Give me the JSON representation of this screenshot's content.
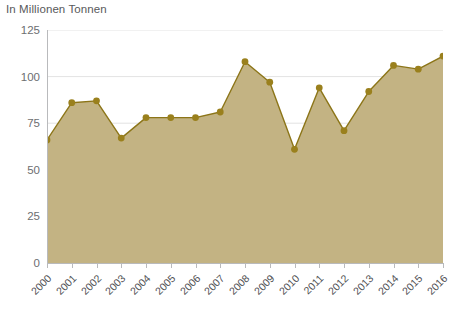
{
  "chart_data": {
    "type": "area",
    "title": "In Millionen Tonnen",
    "xlabel": "",
    "ylabel": "In Millionen Tonnen",
    "categories": [
      "2000",
      "2001",
      "2002",
      "2003",
      "2004",
      "2005",
      "2006",
      "2007",
      "2008",
      "2009",
      "2010",
      "2011",
      "2012",
      "2013",
      "2014",
      "2015",
      "2016"
    ],
    "values": [
      66,
      86,
      87,
      67,
      78,
      78,
      78,
      81,
      108,
      97,
      61,
      94,
      71,
      92,
      106,
      104,
      111
    ],
    "series": [
      {
        "name": "In Millionen Tonnen",
        "values": [
          66,
          86,
          87,
          67,
          78,
          78,
          78,
          81,
          108,
          97,
          61,
          94,
          71,
          92,
          106,
          104,
          111
        ]
      }
    ],
    "ylim": [
      0,
      125
    ],
    "yticks": [
      0,
      25,
      50,
      75,
      100,
      125
    ],
    "ytick_labels": [
      "0",
      "25",
      "50",
      "75",
      "100",
      "125"
    ],
    "grid": true,
    "legend": "none",
    "colors": {
      "area_fill": "#c3b383",
      "line": "#8c7518",
      "marker": "#9a801d",
      "grid": "#e3e3e3",
      "axis": "#b9babc",
      "text": "#58595b",
      "background": "#ffffff"
    }
  }
}
